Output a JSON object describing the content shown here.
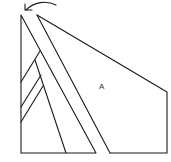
{
  "diagram": {
    "labels": {
      "region_a": "A"
    },
    "colors": {
      "line": "#1a1a1a",
      "background": "#ffffff"
    },
    "elements": {
      "rotation_arrow": "curved-arrow-left",
      "left_triangle": "triangle",
      "strip": "parallel-strip",
      "region_a": "polygon",
      "hatches": 3
    }
  }
}
